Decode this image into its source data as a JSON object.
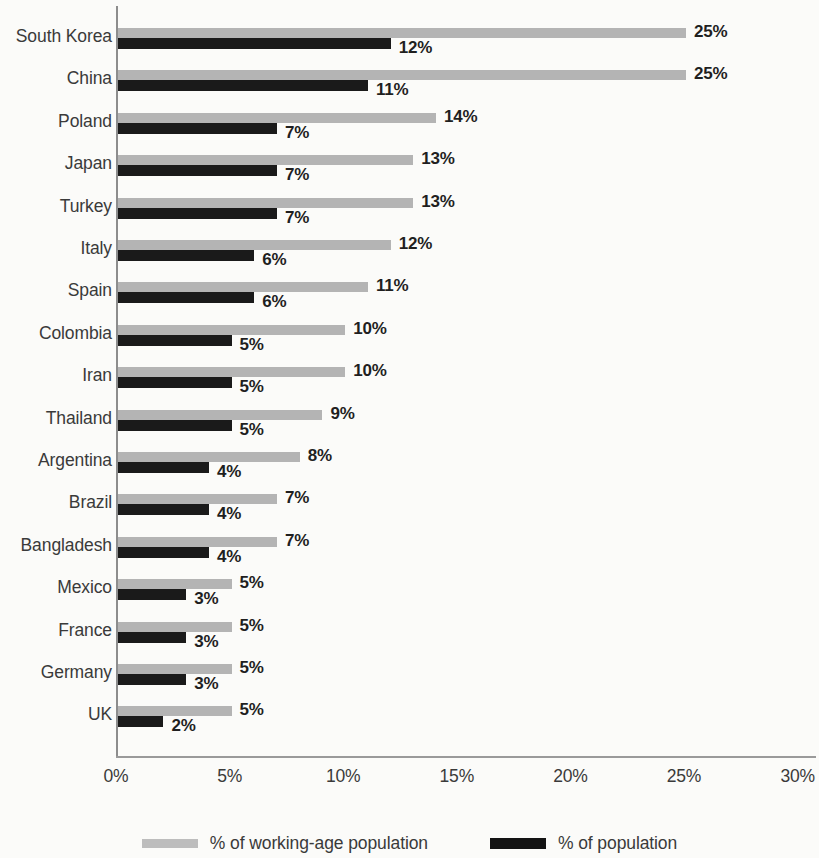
{
  "chart_data": {
    "type": "bar",
    "orientation": "horizontal",
    "title": "",
    "xlabel": "",
    "ylabel": "",
    "xlim": [
      0,
      30
    ],
    "xticks": [
      "0%",
      "5%",
      "10%",
      "15%",
      "20%",
      "25%",
      "30%"
    ],
    "xtick_values": [
      0,
      5,
      10,
      15,
      20,
      25,
      30
    ],
    "grid": false,
    "legend_position": "bottom",
    "categories": [
      "South Korea",
      "China",
      "Poland",
      "Japan",
      "Turkey",
      "Italy",
      "Spain",
      "Colombia",
      "Iran",
      "Thailand",
      "Argentina",
      "Brazil",
      "Bangladesh",
      "Mexico",
      "France",
      "Germany",
      "UK"
    ],
    "series": [
      {
        "name": "% of working-age population",
        "color": "#b4b4b4",
        "values": [
          25,
          25,
          14,
          13,
          13,
          12,
          11,
          10,
          10,
          9,
          8,
          7,
          7,
          5,
          5,
          5,
          5
        ],
        "labels": [
          "25%",
          "25%",
          "14%",
          "13%",
          "13%",
          "12%",
          "11%",
          "10%",
          "10%",
          "9%",
          "8%",
          "7%",
          "7%",
          "5%",
          "5%",
          "5%",
          "5%"
        ]
      },
      {
        "name": "% of population",
        "color": "#1a1a1a",
        "values": [
          12,
          11,
          7,
          7,
          7,
          6,
          6,
          5,
          5,
          5,
          4,
          4,
          4,
          3,
          3,
          3,
          2
        ],
        "labels": [
          "12%",
          "11%",
          "7%",
          "7%",
          "7%",
          "6%",
          "6%",
          "5%",
          "5%",
          "5%",
          "4%",
          "4%",
          "4%",
          "3%",
          "3%",
          "3%",
          "2%"
        ]
      }
    ]
  },
  "legend": {
    "items": [
      {
        "label": "% of working-age population",
        "swatch": "working"
      },
      {
        "label": "% of population",
        "swatch": "pop"
      }
    ]
  }
}
